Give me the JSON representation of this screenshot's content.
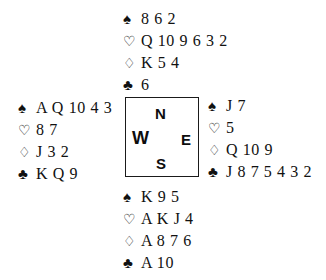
{
  "diagram": {
    "type": "bridge-deal",
    "suit_glyphs": {
      "spades": "♠",
      "hearts": "♡",
      "diamonds": "♢",
      "clubs": "♣"
    },
    "compass": {
      "north": "N",
      "west": "W",
      "east": "E",
      "south": "S"
    },
    "hands": {
      "north": {
        "label": "North",
        "spades": "8 6 2",
        "hearts": "Q 10 9 6 3 2",
        "diamonds": "K 5 4",
        "clubs": "6"
      },
      "west": {
        "label": "West",
        "spades": "A Q 10 4 3",
        "hearts": "8 7",
        "diamonds": "J 3 2",
        "clubs": "K Q 9"
      },
      "east": {
        "label": "East",
        "spades": "J 7",
        "hearts": "5",
        "diamonds": "Q 10 9",
        "clubs": "J 8 7 5 4 3 2"
      },
      "south": {
        "label": "South",
        "spades": "K 9 5",
        "hearts": "A K J 4",
        "diamonds": "A 8 7 6",
        "clubs": "A 10"
      }
    }
  }
}
